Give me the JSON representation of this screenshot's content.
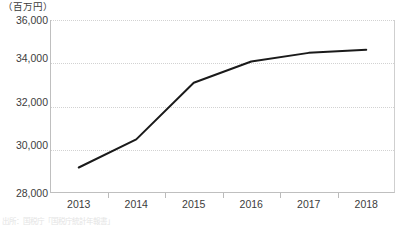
{
  "chart_data": {
    "type": "line",
    "title": "",
    "subtitle": "",
    "xlabel": "",
    "ylabel": "",
    "unit_label": "（百万円）",
    "categories": [
      "2013",
      "2014",
      "2015",
      "2016",
      "2017",
      "2018"
    ],
    "series": [
      {
        "name": "",
        "values": [
          29180,
          30480,
          33100,
          34080,
          34480,
          34620
        ],
        "color": "#1a1a1a",
        "line_width": 2,
        "markers": false
      }
    ],
    "ylim": [
      28000,
      36000
    ],
    "yticks": [
      28000,
      30000,
      32000,
      34000,
      36000
    ],
    "ytick_labels": [
      "28,000",
      "30,000",
      "32,000",
      "34,000",
      "36,000"
    ],
    "grid": {
      "horizontal": true,
      "vertical": false,
      "style": "dotted",
      "color": "#d2d2d2"
    },
    "legend": {
      "visible": false,
      "position": "none"
    },
    "axis": {
      "left_border": true,
      "right_border": true,
      "bottom_border": true,
      "top_border": false,
      "xticks_at_category_boundaries": true
    }
  },
  "source_note": "出所：国税庁「国税庁統計年報書」",
  "clipped_title": "課税対象額の推移"
}
